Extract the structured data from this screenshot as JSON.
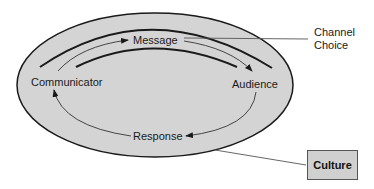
{
  "diagram": {
    "nodes": {
      "communicator": "Communicator",
      "message": "Message",
      "audience": "Audience",
      "response": "Response"
    },
    "callouts": {
      "channel_choice": "Channel\nChoice",
      "channel_line1": "Channel",
      "channel_line2": "Choice",
      "culture": "Culture"
    },
    "colors": {
      "ellipse_fill": "#d4d4d4",
      "ellipse_stroke": "#1a1a1a",
      "culture_fill": "#d0d0d0",
      "line": "#555555"
    }
  }
}
